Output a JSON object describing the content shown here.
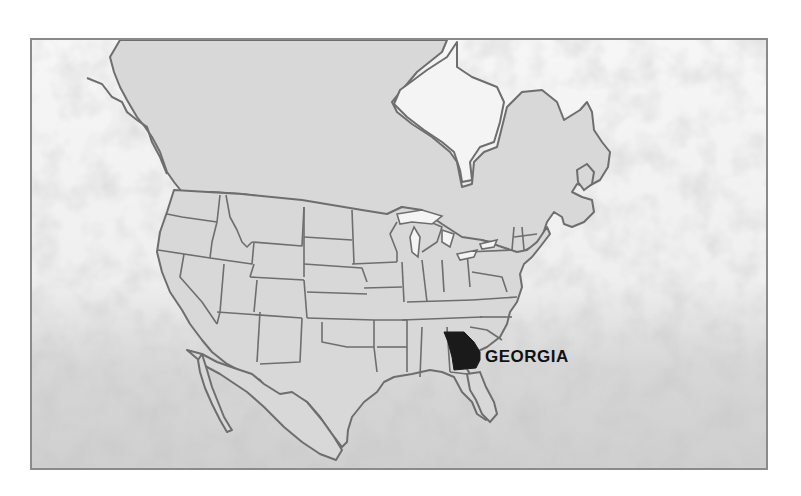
{
  "map": {
    "title": "Location map of Georgia in North America",
    "highlighted_region": {
      "name": "Georgia",
      "label": "GEORGIA",
      "fill": "#1a1a1a"
    },
    "colors": {
      "land": "#d8d8d8",
      "border": "#6e6e6e",
      "water_light": "#f3f3f3",
      "water_dark": "#c9c9c9",
      "frame": "#8a8a8a",
      "label": "#111111"
    },
    "regions_shown": [
      "Canada",
      "United States",
      "Mexico",
      "Gulf of Mexico",
      "Atlantic Ocean",
      "Pacific Ocean",
      "Hudson Bay"
    ]
  }
}
